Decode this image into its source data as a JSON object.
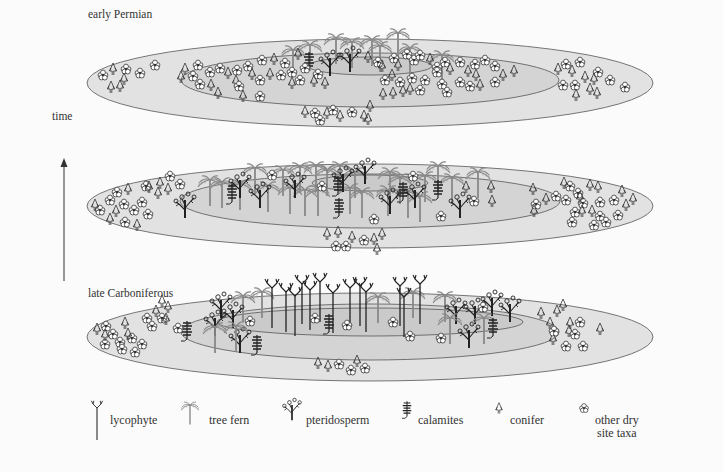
{
  "labels": {
    "top_period": "early Permian",
    "bottom_period": "late Carboniferous",
    "axis": "time"
  },
  "colors": {
    "outer_disc": "#e2e2e2",
    "middle_disc": "#d4d4d4",
    "inner_disc": "#cacaca",
    "outline": "#555555",
    "dark_plant": "#222222",
    "tree_fern": "#8a8a8a"
  },
  "panels": [
    {
      "id": "early-permian",
      "order": "top",
      "label": "early Permian",
      "rings": [
        "outer: conifers, other dry site taxa",
        "middle: conifers, other dry site taxa",
        "center: few tree ferns, pteridosperms, calamites"
      ]
    },
    {
      "id": "intermediate",
      "order": "middle",
      "rings": [
        "outer: conifers, other dry site taxa",
        "middle: tree ferns, pteridosperms, calamites",
        "center: tree ferns, pteridosperms, calamites"
      ]
    },
    {
      "id": "late-carboniferous",
      "order": "bottom",
      "label": "late Carboniferous",
      "rings": [
        "outer: conifers, other dry site taxa",
        "middle: pteridosperms, tree ferns, calamites",
        "center: lycophytes"
      ]
    }
  ],
  "legend": [
    {
      "key": "lycophyte",
      "label": "lycophyte"
    },
    {
      "key": "tree-fern",
      "label": "tree fern"
    },
    {
      "key": "pteridosperm",
      "label": "pteridosperm"
    },
    {
      "key": "calamites",
      "label": "calamites"
    },
    {
      "key": "conifer",
      "label": "conifer"
    },
    {
      "key": "other-dry",
      "label": "other dry",
      "label2": "site taxa"
    }
  ]
}
